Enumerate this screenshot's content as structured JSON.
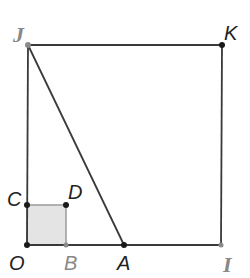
{
  "diagram": {
    "colors": {
      "line": "#3a3a3a",
      "point_dark": "#1a1a1a",
      "point_gray": "#8a8a8a",
      "label_dark": "#222222",
      "label_gray": "#888888",
      "shaded_fill": "#e4e4e4",
      "shaded_stroke": "#9a9a9a"
    },
    "points": {
      "J": {
        "label": "J",
        "x": 28,
        "y": 45
      },
      "K": {
        "label": "K",
        "x": 222,
        "y": 45
      },
      "C": {
        "label": "C",
        "x": 27,
        "y": 205
      },
      "D": {
        "label": "D",
        "x": 66,
        "y": 205
      },
      "O": {
        "label": "O",
        "x": 27,
        "y": 245
      },
      "B": {
        "label": "B",
        "x": 66,
        "y": 245
      },
      "A": {
        "label": "A",
        "x": 124,
        "y": 245
      },
      "I": {
        "label": "I",
        "x": 221,
        "y": 245
      }
    },
    "segments": [
      [
        "J",
        "K"
      ],
      [
        "K",
        "I"
      ],
      [
        "I",
        "O"
      ],
      [
        "O",
        "J"
      ],
      [
        "J",
        "A"
      ]
    ],
    "shaded_square": [
      "O",
      "B",
      "D",
      "C"
    ]
  }
}
